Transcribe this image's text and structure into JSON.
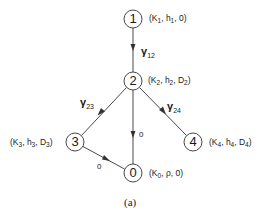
{
  "diagram": {
    "caption": "(a)",
    "nodes": [
      {
        "id": "1",
        "x": 133,
        "y": 19,
        "label": {
          "k": "K",
          "k_sub": "1",
          "h": "h",
          "h_sub": "1",
          "d": "0",
          "d_sub": ""
        }
      },
      {
        "id": "2",
        "x": 133,
        "y": 81,
        "label": {
          "k": "K",
          "k_sub": "2",
          "h": "h",
          "h_sub": "2",
          "d": "D",
          "d_sub": "2"
        }
      },
      {
        "id": "3",
        "x": 75,
        "y": 142,
        "label": {
          "k": "K",
          "k_sub": "3",
          "h": "h",
          "h_sub": "3",
          "d": "D",
          "d_sub": "3"
        }
      },
      {
        "id": "4",
        "x": 193,
        "y": 142,
        "label": {
          "k": "K",
          "k_sub": "4",
          "h": "h",
          "h_sub": "4",
          "d": "D",
          "d_sub": "4"
        }
      },
      {
        "id": "0",
        "x": 133,
        "y": 173,
        "label": {
          "k": "K",
          "k_sub": "0",
          "h": "ρ",
          "h_sub": "",
          "d": "0",
          "d_sub": ""
        }
      }
    ],
    "edges": [
      {
        "from": "1",
        "to": "2",
        "label": "γ",
        "label_sub": "12"
      },
      {
        "from": "2",
        "to": "3",
        "label": "γ",
        "label_sub": "23"
      },
      {
        "from": "2",
        "to": "4",
        "label": "γ",
        "label_sub": "24"
      },
      {
        "from": "2",
        "to": "0",
        "label": "0",
        "label_sub": ""
      },
      {
        "from": "3",
        "to": "0",
        "label": "0",
        "label_sub": ""
      }
    ],
    "colors": {
      "line": "#333333",
      "text": "#1a1a1a",
      "background": "#ffffff"
    }
  }
}
